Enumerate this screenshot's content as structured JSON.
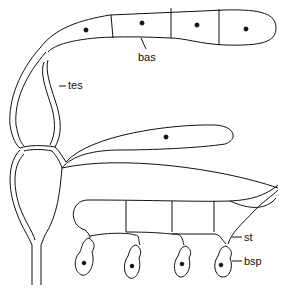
{
  "diagram": {
    "type": "biological-illustration",
    "labels": {
      "bas": "bas",
      "tes": "tes",
      "st": "st",
      "bsp": "bsp"
    },
    "upper_cells_with_nucleus": 4,
    "middle_cells_with_nucleus": 1,
    "spores_count": 4,
    "colors": {
      "stroke": "#111111",
      "background": "#ffffff"
    }
  }
}
